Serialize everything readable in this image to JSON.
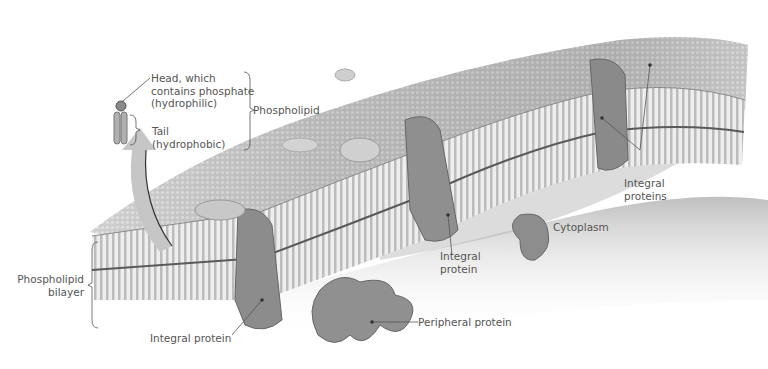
{
  "diagram": {
    "colors": {
      "background": "#ffffff",
      "membrane_light": "#e6e6e6",
      "membrane_mid": "#b8b8b8",
      "membrane_dark": "#6e6e6e",
      "protein": "#8a8a8a",
      "label_text": "#555555",
      "leader_line": "#555555",
      "arrow": "#c4c4c4"
    },
    "labels": {
      "head": [
        "Head, which",
        "contains phosphate",
        "(hydrophilic)"
      ],
      "tail": [
        "Tail",
        "(hydrophobic)"
      ],
      "phospholipid": "Phospholipid",
      "bilayer": [
        "Phospholipid",
        "bilayer"
      ],
      "integral_protein_left": "Integral protein",
      "integral_protein_center": [
        "Integral",
        "protein"
      ],
      "integral_proteins_right": [
        "Integral",
        "proteins"
      ],
      "peripheral_protein": "Peripheral protein",
      "cytoplasm": "Cytoplasm"
    }
  }
}
